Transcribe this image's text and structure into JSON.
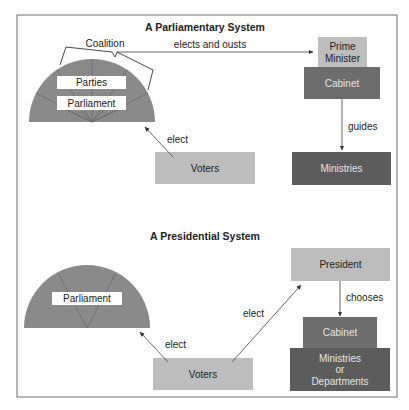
{
  "colors": {
    "border": "#6e6e6e",
    "light_box": "#bdbdbd",
    "dark_box": "#5c5c5c",
    "medium_box": "#6d6d6d",
    "hemicycle": "#8a8a8a",
    "label_box": "#ffffff"
  },
  "parliamentary": {
    "title": "A Parliamentary System",
    "coalition_label": "Coalition",
    "parties_label": "Parties",
    "parliament_label": "Parliament",
    "elects_and_ousts_label": "elects and ousts",
    "prime_minister_line1": "Prime",
    "prime_minister_line2": "Minister",
    "cabinet_label": "Cabinet",
    "guides_label": "guides",
    "ministries_label": "Ministries",
    "voters_label": "Voters",
    "elect_label": "elect"
  },
  "presidential": {
    "title": "A Presidential System",
    "parliament_label": "Parliament",
    "voters_label": "Voters",
    "elect_parliament_label": "elect",
    "elect_president_label": "elect",
    "president_label": "President",
    "chooses_label": "chooses",
    "cabinet_label": "Cabinet",
    "ministries_line1": "Ministries",
    "ministries_line2": "or",
    "ministries_line3": "Departments"
  }
}
